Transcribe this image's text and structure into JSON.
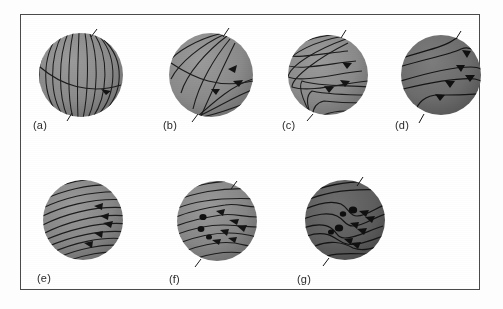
{
  "figure": {
    "type": "scientific-diagram",
    "caption_labels": [
      "(a)",
      "(b)",
      "(c)",
      "(d)",
      "(e)",
      "(f)",
      "(g)"
    ],
    "frame_color": "#4a4a4a",
    "background_color": "#ffffff",
    "page_background": "#fdfdfd",
    "line_color": "#1a1a1a",
    "spot_color": "#121212"
  },
  "panels": [
    {
      "id": "a",
      "label": "(a)",
      "row": 1,
      "sphere_fill": "#8c8c8c",
      "sphere_shade": "#6f6f6f",
      "description": "poloidal dipole field, meridional lines from pole to pole",
      "field_stage": "poloidal",
      "line_count": 11,
      "arrow_count": 1,
      "spot_count": 0,
      "cx": 72,
      "cy": 62,
      "r": 44
    },
    {
      "id": "b",
      "label": "(b)",
      "row": 1,
      "sphere_fill": "#8c8c8c",
      "sphere_shade": "#6f6f6f",
      "description": "differential rotation begins shearing field lines toward equator",
      "field_stage": "shearing-early",
      "line_count": 8,
      "arrow_count": 3,
      "spot_count": 0,
      "cx": 202,
      "cy": 62,
      "r": 44
    },
    {
      "id": "c",
      "label": "(c)",
      "row": 1,
      "sphere_fill": "#8c8c8c",
      "sphere_shade": "#6f6f6f",
      "description": "field lines further wound, nested hooks stretching along equator",
      "field_stage": "shearing-mid",
      "line_count": 8,
      "arrow_count": 3,
      "spot_count": 0,
      "cx": 319,
      "cy": 62,
      "r": 42
    },
    {
      "id": "d",
      "label": "(d)",
      "row": 1,
      "sphere_fill": "#6e6e6e",
      "sphere_shade": "#565656",
      "description": "field mostly toroidal, stretched around the star",
      "field_stage": "toroidal-early",
      "line_count": 5,
      "arrow_count": 5,
      "spot_count": 0,
      "cx": 432,
      "cy": 62,
      "r": 42
    },
    {
      "id": "e",
      "label": "(e)",
      "row": 2,
      "sphere_fill": "#8a8a8a",
      "sphere_shade": "#6d6d6d",
      "description": "fully toroidal field, many parallel bands wound around the star",
      "field_stage": "toroidal-wound",
      "line_count": 12,
      "arrow_count": 5,
      "spot_count": 0,
      "cx": 75,
      "cy": 217,
      "r": 42
    },
    {
      "id": "f",
      "label": "(f)",
      "row": 2,
      "sphere_fill": "#8a8a8a",
      "sphere_shade": "#6d6d6d",
      "description": "kink in toroidal tube rises, a starspot pair emerges",
      "field_stage": "kink-emerging",
      "line_count": 9,
      "arrow_count": 6,
      "spot_count": 3,
      "cx": 207,
      "cy": 217,
      "r": 42
    },
    {
      "id": "g",
      "label": "(g)",
      "row": 2,
      "sphere_fill": "#5f5f5f",
      "sphere_shade": "#4c4c4c",
      "description": "two loops erupt, multiple starspot pairs at the surface",
      "field_stage": "loops-erupted",
      "line_count": 8,
      "arrow_count": 6,
      "spot_count": 4,
      "cx": 334,
      "cy": 214,
      "r": 42
    }
  ]
}
